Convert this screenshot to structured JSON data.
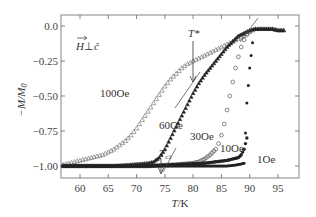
{
  "chart_data": {
    "type": "scatter",
    "title": "",
    "xlabel": "T/K",
    "ylabel": "-M/M0",
    "xlim": [
      56.5,
      98.5
    ],
    "ylim": [
      -1.08,
      0.08
    ],
    "x_ticks": [
      60,
      65,
      70,
      75,
      80,
      85,
      90,
      95
    ],
    "x_tick_labels": [
      "60",
      "65",
      "70",
      "75",
      "80",
      "85",
      "90",
      "95"
    ],
    "y_ticks": [
      0.0,
      -0.25,
      -0.5,
      -0.75,
      -1.0
    ],
    "y_tick_labels": [
      "0.0",
      "-0.25",
      "-0.50",
      "-0.75",
      "-1.00"
    ],
    "grid": false,
    "legend": "none (inline curve labels)",
    "series": [
      {
        "name": "100Oe",
        "marker": "open-triangle",
        "x": [
          57,
          58,
          59,
          60,
          61,
          62,
          63,
          64,
          65,
          66,
          67,
          68,
          69,
          70,
          71,
          72,
          73,
          74,
          75,
          76,
          77,
          78,
          79,
          80,
          81,
          82,
          83,
          84,
          85,
          86,
          87,
          88,
          89,
          90,
          91,
          92,
          93,
          94,
          95,
          96
        ],
        "y": [
          -0.99,
          -0.98,
          -0.97,
          -0.96,
          -0.95,
          -0.94,
          -0.93,
          -0.92,
          -0.9,
          -0.88,
          -0.85,
          -0.82,
          -0.78,
          -0.73,
          -0.67,
          -0.61,
          -0.55,
          -0.49,
          -0.43,
          -0.38,
          -0.34,
          -0.3,
          -0.27,
          -0.25,
          -0.23,
          -0.21,
          -0.19,
          -0.17,
          -0.15,
          -0.13,
          -0.11,
          -0.09,
          -0.07,
          -0.04,
          -0.02,
          -0.02,
          -0.02,
          -0.02,
          -0.03,
          -0.03
        ]
      },
      {
        "name": "60Oe",
        "marker": "filled-triangle",
        "x": [
          57,
          60,
          63,
          66,
          69,
          72,
          73,
          74,
          75,
          76,
          77,
          78,
          79,
          80,
          81,
          82,
          83,
          84,
          85,
          86,
          87,
          88,
          89,
          90,
          91,
          92,
          93,
          94,
          95,
          96
        ],
        "y": [
          -1.0,
          -1.0,
          -1.0,
          -1.0,
          -0.99,
          -0.98,
          -0.97,
          -0.94,
          -0.88,
          -0.8,
          -0.72,
          -0.64,
          -0.56,
          -0.48,
          -0.41,
          -0.35,
          -0.3,
          -0.25,
          -0.2,
          -0.15,
          -0.11,
          -0.07,
          -0.05,
          -0.03,
          -0.02,
          -0.02,
          -0.02,
          -0.02,
          -0.03,
          -0.03
        ]
      },
      {
        "name": "30Oe",
        "marker": "open-circle",
        "x": [
          57,
          62,
          67,
          72,
          77,
          80,
          81,
          82,
          83,
          84,
          84.5,
          85,
          85.5,
          86,
          86.5,
          87,
          87.5,
          88,
          88.5,
          89,
          89.5,
          90
        ],
        "y": [
          -1.0,
          -1.0,
          -1.0,
          -1.0,
          -0.99,
          -0.98,
          -0.97,
          -0.95,
          -0.92,
          -0.88,
          -0.84,
          -0.78,
          -0.7,
          -0.6,
          -0.5,
          -0.4,
          -0.3,
          -0.22,
          -0.15,
          -0.1,
          -0.06,
          -0.04
        ]
      },
      {
        "name": "10Oe",
        "marker": "filled-circle",
        "x": [
          57,
          62,
          67,
          72,
          77,
          82,
          84,
          86,
          87,
          88,
          88.5,
          89,
          89.5
        ],
        "y": [
          -1.0,
          -1.0,
          -1.0,
          -1.0,
          -0.99,
          -0.98,
          -0.97,
          -0.96,
          -0.95,
          -0.94,
          -0.92,
          -0.88,
          -0.8
        ]
      },
      {
        "name": "1Oe",
        "marker": "filled-dot",
        "x": [
          57,
          62,
          67,
          72,
          77,
          82,
          86,
          88,
          89,
          89.5,
          90,
          90.5
        ],
        "y": [
          -1.0,
          -1.0,
          -1.0,
          -1.0,
          -1.0,
          -1.0,
          -1.0,
          -0.99,
          -0.98,
          -0.55,
          -0.3,
          -0.12
        ]
      }
    ],
    "annotations": [
      {
        "text": "H⊥c",
        "note": "vector H perpendicular to c-hat",
        "x": 58.5,
        "y": -0.13
      },
      {
        "text": "T*",
        "arrow_to": [
          80,
          -0.41
        ],
        "label_at": [
          80,
          -0.07
        ]
      },
      {
        "text": "Tc1",
        "arrow_to": [
          74,
          -0.97
        ],
        "label_at": [
          74,
          -0.83
        ]
      },
      {
        "text": "100Oe",
        "x": 65.5,
        "y": -0.5
      },
      {
        "text": "60Oe",
        "x": 75,
        "y": -0.73
      },
      {
        "text": "30Oe",
        "x": 79.5,
        "y": -0.86
      },
      {
        "text": "10Oe",
        "x": 84.5,
        "y": -0.92
      },
      {
        "text": "1Oe",
        "x": 91,
        "y": -0.99
      }
    ]
  },
  "labels": {
    "xlabel_T": "T",
    "xlabel_unit": "/K",
    "ylabel_M": "−M/M",
    "ylabel_sub": "0",
    "field_H": "H",
    "field_perp": "⊥",
    "field_c": "ĉ",
    "tstar": "T*",
    "tc1_T": "T",
    "tc1_sub": "c1",
    "curve_100": "100Oe",
    "curve_60": "60Oe",
    "curve_30": "30Oe",
    "curve_10": "10Oe",
    "curve_1": "1Oe",
    "xtick_60": "60",
    "xtick_65": "65",
    "xtick_70": "70",
    "xtick_75": "75",
    "xtick_80": "80",
    "xtick_85": "85",
    "xtick_90": "90",
    "xtick_95": "95",
    "ytick_0": "0.0",
    "ytick_025": "−0.25",
    "ytick_050": "−0.50",
    "ytick_075": "−0.75",
    "ytick_100": "−1.00"
  }
}
